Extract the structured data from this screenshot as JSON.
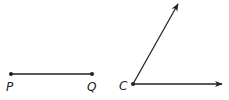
{
  "segment": {
    "endpoints": [
      {
        "label": "P",
        "x": 11,
        "y": 74
      },
      {
        "label": "Q",
        "x": 92,
        "y": 74
      }
    ]
  },
  "angle": {
    "vertex": {
      "label": "C",
      "x": 133,
      "y": 84
    },
    "rays": [
      {
        "name": "upper-ray",
        "to": {
          "x": 178,
          "y": 4
        }
      },
      {
        "name": "horizontal-ray",
        "to": {
          "x": 222,
          "y": 84
        }
      }
    ]
  },
  "colors": {
    "stroke": "#222222"
  }
}
